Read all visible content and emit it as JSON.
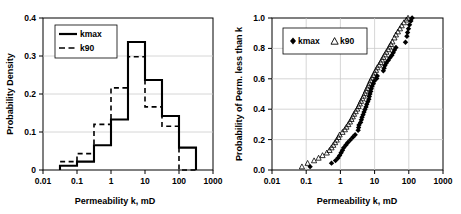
{
  "figure": {
    "title": "",
    "panels": [
      "probability-density-histogram",
      "cumulative-probability-scatter"
    ]
  },
  "chart_data": [
    {
      "type": "line",
      "subtype": "step-histogram",
      "title": "",
      "xlabel": "Permeability k, mD",
      "ylabel": "Probability Density",
      "xscale": "log",
      "xlim": [
        0.01,
        1000
      ],
      "ylim": [
        0,
        0.4
      ],
      "xticks": [
        0.01,
        0.1,
        1,
        10,
        100,
        1000
      ],
      "xtick_labels": [
        "0.01",
        "0.1",
        "1",
        "10",
        "100",
        "1000"
      ],
      "yticks": [
        0,
        0.1,
        0.2,
        0.3,
        0.4
      ],
      "ytick_labels": [
        "0",
        "0.1",
        "0.2",
        "0.3",
        "0.4"
      ],
      "grid": "horizontal",
      "legend_position": "top-left",
      "bin_edges": [
        0.0316,
        0.1,
        0.316,
        1,
        3.16,
        10,
        31.6,
        100,
        316
      ],
      "series": [
        {
          "name": "kmax",
          "style": "solid",
          "color": "#000000",
          "values": [
            0.011,
            0.022,
            0.065,
            0.133,
            0.337,
            0.237,
            0.142,
            0.059
          ]
        },
        {
          "name": "k90",
          "style": "dashed",
          "color": "#000000",
          "values": [
            0.022,
            0.043,
            0.12,
            0.216,
            0.298,
            0.166,
            0.115,
            0.0
          ]
        }
      ]
    },
    {
      "type": "scatter",
      "title": "",
      "xlabel": "Permeability k, mD",
      "ylabel": "Probability of Perm. less than k",
      "xscale": "log",
      "xlim": [
        0.01,
        1000
      ],
      "ylim": [
        0.0,
        1.0
      ],
      "xticks": [
        0.01,
        0.1,
        1,
        10,
        100,
        1000
      ],
      "xtick_labels": [
        "0.01",
        "0.1",
        "1",
        "10",
        "100",
        "1000"
      ],
      "yticks": [
        0.0,
        0.2,
        0.4,
        0.6,
        0.8,
        1.0
      ],
      "ytick_labels": [
        "0.0",
        "0.2",
        "0.4",
        "0.6",
        "0.8",
        "1.0"
      ],
      "grid": "both",
      "legend_position": "top-left",
      "series": [
        {
          "name": "kmax",
          "marker": "filled-diamond",
          "color": "#000000",
          "points": [
            [
              0.13,
              0.022
            ],
            [
              0.55,
              0.045
            ],
            [
              0.72,
              0.062
            ],
            [
              0.85,
              0.079
            ],
            [
              0.95,
              0.096
            ],
            [
              1.05,
              0.113
            ],
            [
              1.15,
              0.13
            ],
            [
              1.25,
              0.147
            ],
            [
              1.45,
              0.164
            ],
            [
              1.65,
              0.181
            ],
            [
              1.95,
              0.198
            ],
            [
              2.3,
              0.215
            ],
            [
              2.7,
              0.232
            ],
            [
              3.3,
              0.262
            ],
            [
              3.4,
              0.279
            ],
            [
              3.5,
              0.296
            ],
            [
              3.9,
              0.313
            ],
            [
              4.1,
              0.33
            ],
            [
              4.3,
              0.347
            ],
            [
              4.6,
              0.364
            ],
            [
              4.9,
              0.381
            ],
            [
              5.2,
              0.398
            ],
            [
              5.6,
              0.415
            ],
            [
              5.9,
              0.432
            ],
            [
              6.3,
              0.449
            ],
            [
              6.8,
              0.466
            ],
            [
              7.0,
              0.483
            ],
            [
              7.3,
              0.5
            ],
            [
              7.7,
              0.517
            ],
            [
              8.0,
              0.534
            ],
            [
              8.4,
              0.551
            ],
            [
              9.2,
              0.568
            ],
            [
              9.8,
              0.585
            ],
            [
              11.5,
              0.602
            ],
            [
              12.0,
              0.619
            ],
            [
              18.0,
              0.653
            ],
            [
              19.0,
              0.67
            ],
            [
              20.0,
              0.687
            ],
            [
              22.0,
              0.704
            ],
            [
              25.0,
              0.721
            ],
            [
              28.0,
              0.738
            ],
            [
              32.0,
              0.755
            ],
            [
              35.0,
              0.772
            ],
            [
              38.0,
              0.789
            ],
            [
              42.0,
              0.806
            ],
            [
              80.0,
              0.84
            ],
            [
              88.0,
              0.88
            ],
            [
              92.0,
              0.905
            ],
            [
              98.0,
              0.93
            ],
            [
              105.0,
              0.955
            ],
            [
              115.0,
              0.98
            ],
            [
              125.0,
              1.0
            ]
          ]
        },
        {
          "name": "k90",
          "marker": "open-triangle",
          "color": "#000000",
          "points": [
            [
              0.075,
              0.022
            ],
            [
              0.11,
              0.045
            ],
            [
              0.17,
              0.062
            ],
            [
              0.23,
              0.079
            ],
            [
              0.3,
              0.096
            ],
            [
              0.4,
              0.113
            ],
            [
              0.48,
              0.13
            ],
            [
              0.55,
              0.147
            ],
            [
              0.62,
              0.164
            ],
            [
              0.7,
              0.181
            ],
            [
              0.78,
              0.198
            ],
            [
              0.88,
              0.215
            ],
            [
              0.95,
              0.232
            ],
            [
              1.15,
              0.249
            ],
            [
              1.35,
              0.266
            ],
            [
              1.5,
              0.283
            ],
            [
              1.7,
              0.3
            ],
            [
              1.9,
              0.317
            ],
            [
              2.1,
              0.334
            ],
            [
              2.3,
              0.351
            ],
            [
              2.5,
              0.368
            ],
            [
              2.8,
              0.385
            ],
            [
              3.1,
              0.402
            ],
            [
              3.4,
              0.419
            ],
            [
              3.7,
              0.436
            ],
            [
              4.0,
              0.453
            ],
            [
              4.4,
              0.47
            ],
            [
              4.8,
              0.487
            ],
            [
              5.2,
              0.504
            ],
            [
              5.6,
              0.521
            ],
            [
              6.1,
              0.538
            ],
            [
              6.6,
              0.555
            ],
            [
              7.1,
              0.572
            ],
            [
              7.7,
              0.589
            ],
            [
              8.4,
              0.606
            ],
            [
              9.2,
              0.623
            ],
            [
              10.0,
              0.64
            ],
            [
              11.0,
              0.657
            ],
            [
              12.0,
              0.674
            ],
            [
              13.5,
              0.691
            ],
            [
              15.0,
              0.708
            ],
            [
              16.5,
              0.725
            ],
            [
              18.0,
              0.742
            ],
            [
              20.0,
              0.759
            ],
            [
              22.0,
              0.776
            ],
            [
              25.0,
              0.793
            ],
            [
              27.0,
              0.81
            ],
            [
              30.0,
              0.827
            ],
            [
              33.0,
              0.844
            ],
            [
              38.0,
              0.87
            ],
            [
              42.0,
              0.89
            ],
            [
              48.0,
              0.91
            ],
            [
              55.0,
              0.93
            ],
            [
              62.0,
              0.95
            ],
            [
              72.0,
              0.97
            ],
            [
              85.0,
              0.988
            ],
            [
              95.0,
              1.0
            ]
          ]
        }
      ]
    }
  ],
  "left_chart": {
    "ylabel": "Probability Density",
    "xlabel": "Permeability k, mD",
    "ytick_labels": [
      "0",
      "0.1",
      "0.2",
      "0.3",
      "0.4"
    ],
    "xtick_labels": [
      "0.01",
      "0.1",
      "1",
      "10",
      "100",
      "1000"
    ],
    "legend": {
      "kmax": "kmax",
      "k90": "k90"
    }
  },
  "right_chart": {
    "ylabel": "Probability of Perm. less than k",
    "xlabel": "Permeability k, mD",
    "ytick_labels": [
      "0.0",
      "0.2",
      "0.4",
      "0.6",
      "0.8",
      "1.0"
    ],
    "xtick_labels": [
      "0.01",
      "0.1",
      "1",
      "10",
      "100",
      "1000"
    ],
    "legend": {
      "kmax": "kmax",
      "k90": "k90"
    }
  }
}
